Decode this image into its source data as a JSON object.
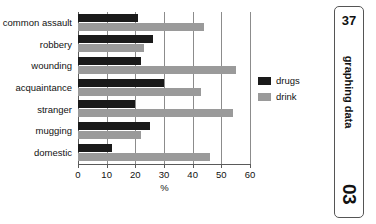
{
  "side_tab": {
    "number_top": "37",
    "title": "graphing data",
    "number_bottom": "03"
  },
  "chart_data": {
    "type": "bar",
    "orientation": "horizontal",
    "title": "",
    "xlabel": "%",
    "ylabel": "",
    "xlim": [
      0,
      60
    ],
    "xticks": [
      0,
      10,
      20,
      30,
      40,
      50,
      60
    ],
    "xticklabels": [
      "0",
      "10",
      "20",
      "30",
      "40",
      "50",
      "60"
    ],
    "grid": true,
    "grid_axis": "x",
    "legend_position": "right",
    "categories": [
      "common assault",
      "robbery",
      "wounding",
      "acquaintance",
      "stranger",
      "mugging",
      "domestic"
    ],
    "series": [
      {
        "name": "drugs",
        "color": "#1a1a1a",
        "values": [
          21,
          26,
          22,
          30,
          20,
          25,
          12
        ]
      },
      {
        "name": "drink",
        "color": "#9a9a9a",
        "values": [
          44,
          23,
          55,
          43,
          54,
          22,
          46
        ]
      }
    ]
  }
}
